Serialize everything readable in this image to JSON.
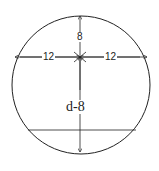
{
  "diagram": {
    "shape": "circle with chord",
    "labels": {
      "top_distance": "8",
      "left_half_width": "12",
      "right_half_width": "12",
      "lower_distance": "d-8"
    },
    "colors": {
      "stroke": "#222222",
      "background": "#ffffff"
    }
  }
}
